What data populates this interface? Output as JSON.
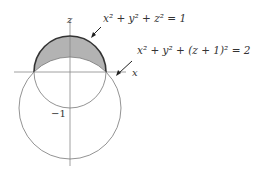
{
  "diagram": {
    "axis_labels": {
      "z": "z",
      "x": "x"
    },
    "tick_label": "−1",
    "equations": {
      "sphere": "x² + y² + z² = 1",
      "shifted_sphere": "x² + y² + (z + 1)² = 2"
    },
    "colors": {
      "shaded_region": "#b3b3b3",
      "outline": "#333333",
      "axes": "#888888"
    }
  }
}
